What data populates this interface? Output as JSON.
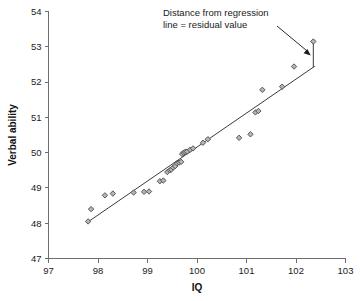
{
  "chart_data": {
    "type": "scatter",
    "title": "",
    "xlabel": "IQ",
    "ylabel": "Verbal ability",
    "xlim": [
      97,
      103
    ],
    "ylim": [
      47,
      54
    ],
    "xticks": [
      97,
      98,
      99,
      100,
      101,
      102,
      103
    ],
    "yticks": [
      47,
      48,
      49,
      50,
      51,
      52,
      53,
      54
    ],
    "grid": false,
    "legend": false,
    "marker": "diamond",
    "marker_fill": "#b5b5b5",
    "marker_edge": "#4a4a4a",
    "line_color": "#3a3a3a",
    "annotations": [
      {
        "name": "residual-annotation",
        "line1": "Distance from regression",
        "line2": "line = residual value",
        "points_to_x": 102.35,
        "points_to_y": 52.75
      }
    ],
    "regression_line": {
      "x": [
        97.78,
        102.38
      ],
      "y": [
        48.02,
        52.45
      ]
    },
    "residual_segment": {
      "x": 102.35,
      "y_point": 53.15,
      "y_line": 52.42
    },
    "points": [
      {
        "x": 97.8,
        "y": 48.05
      },
      {
        "x": 97.86,
        "y": 48.4
      },
      {
        "x": 98.14,
        "y": 48.79
      },
      {
        "x": 98.3,
        "y": 48.84
      },
      {
        "x": 98.72,
        "y": 48.87
      },
      {
        "x": 98.93,
        "y": 48.89
      },
      {
        "x": 99.03,
        "y": 48.9
      },
      {
        "x": 99.25,
        "y": 49.19
      },
      {
        "x": 99.32,
        "y": 49.21
      },
      {
        "x": 99.4,
        "y": 49.45
      },
      {
        "x": 99.45,
        "y": 49.5
      },
      {
        "x": 99.48,
        "y": 49.52
      },
      {
        "x": 99.52,
        "y": 49.58
      },
      {
        "x": 99.56,
        "y": 49.62
      },
      {
        "x": 99.6,
        "y": 49.7
      },
      {
        "x": 99.64,
        "y": 49.72
      },
      {
        "x": 99.68,
        "y": 49.74
      },
      {
        "x": 99.7,
        "y": 49.96
      },
      {
        "x": 99.73,
        "y": 50.0
      },
      {
        "x": 99.76,
        "y": 50.02
      },
      {
        "x": 99.8,
        "y": 50.03
      },
      {
        "x": 99.86,
        "y": 50.08
      },
      {
        "x": 99.92,
        "y": 50.12
      },
      {
        "x": 100.12,
        "y": 50.28
      },
      {
        "x": 100.22,
        "y": 50.38
      },
      {
        "x": 100.85,
        "y": 50.42
      },
      {
        "x": 101.08,
        "y": 50.52
      },
      {
        "x": 101.18,
        "y": 51.14
      },
      {
        "x": 101.24,
        "y": 51.18
      },
      {
        "x": 101.32,
        "y": 51.78
      },
      {
        "x": 101.72,
        "y": 51.87
      },
      {
        "x": 101.96,
        "y": 52.44
      },
      {
        "x": 102.35,
        "y": 53.15
      }
    ]
  }
}
